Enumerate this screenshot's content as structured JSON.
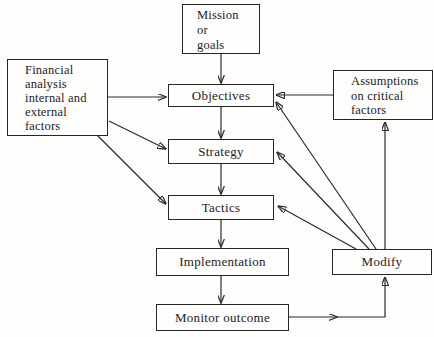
{
  "diagram": {
    "background_color": "#fdfdfc",
    "line_color": "#2b2b2b",
    "box_border_color": "#262626",
    "nodes": {
      "mission": {
        "label": "Mission\nor\ngoals"
      },
      "financial": {
        "label": "Financial\nanalysis\ninternal and\nexternal\nfactors"
      },
      "objectives": {
        "label": "Objectives"
      },
      "assumptions": {
        "label": "Assumptions\non critical\nfactors"
      },
      "strategy": {
        "label": "Strategy"
      },
      "tactics": {
        "label": "Tactics"
      },
      "implementation": {
        "label": "Implementation"
      },
      "modify": {
        "label": "Modify"
      },
      "monitor": {
        "label": "Monitor outcome"
      }
    },
    "edges": [
      {
        "from": "mission",
        "to": "objectives"
      },
      {
        "from": "financial",
        "to": "objectives"
      },
      {
        "from": "assumptions",
        "to": "objectives"
      },
      {
        "from": "objectives",
        "to": "strategy"
      },
      {
        "from": "financial",
        "to": "strategy"
      },
      {
        "from": "strategy",
        "to": "tactics"
      },
      {
        "from": "financial",
        "to": "tactics"
      },
      {
        "from": "tactics",
        "to": "implementation"
      },
      {
        "from": "implementation",
        "to": "monitor"
      },
      {
        "from": "monitor",
        "to": "modify"
      },
      {
        "from": "modify",
        "to": "objectives"
      },
      {
        "from": "modify",
        "to": "strategy"
      },
      {
        "from": "modify",
        "to": "tactics"
      },
      {
        "from": "modify",
        "to": "assumptions"
      }
    ]
  }
}
